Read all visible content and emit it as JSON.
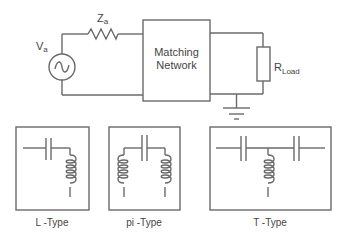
{
  "circuit": {
    "source_label": "V",
    "source_sub": "a",
    "impedance_label": "Z",
    "impedance_sub": "a",
    "matching_box_line1": "Matching",
    "matching_box_line2": "Network",
    "load_label": "R",
    "load_sub": "Load"
  },
  "networks": [
    {
      "label": "L -Type"
    },
    {
      "label": "pi -Type"
    },
    {
      "label": "T -Type"
    }
  ],
  "colors": {
    "line": "#6a6a6a",
    "text": "#444444",
    "background": "#ffffff"
  }
}
